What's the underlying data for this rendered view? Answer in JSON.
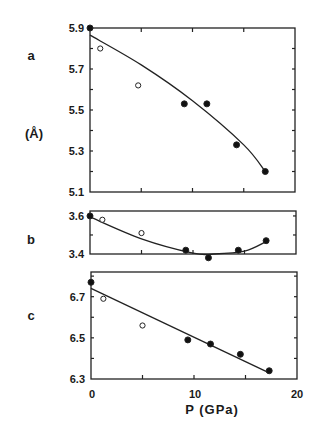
{
  "figure": {
    "ylabel_unit": "(Å)",
    "xlabel": "P (GPa)",
    "x_ticks": [
      "0",
      "10",
      "20"
    ]
  },
  "chart_data": [
    {
      "type": "scatter",
      "panel": "a",
      "title": "a",
      "xlabel": "P (GPa)",
      "ylabel": "(Å)",
      "xlim": [
        0,
        20
      ],
      "ylim": [
        5.1,
        5.9
      ],
      "y_ticks": [
        "5.9",
        "5.7",
        "5.5",
        "5.3",
        "5.1"
      ],
      "series": [
        {
          "name": "open circles",
          "marker": "open",
          "x": [
            1.0,
            4.7
          ],
          "y": [
            5.8,
            5.62
          ]
        },
        {
          "name": "filled circles",
          "marker": "filled",
          "x": [
            0,
            9.2,
            11.4,
            14.3,
            17.1
          ],
          "y": [
            5.9,
            5.53,
            5.53,
            5.33,
            5.2
          ]
        },
        {
          "name": "fit curve",
          "marker": "line",
          "x": [
            0,
            5,
            10,
            15,
            17.1
          ],
          "y": [
            5.865,
            5.72,
            5.545,
            5.33,
            5.2
          ]
        }
      ]
    },
    {
      "type": "scatter",
      "panel": "b",
      "title": "b",
      "xlabel": "P (GPa)",
      "ylabel": "(Å)",
      "xlim": [
        0,
        20
      ],
      "ylim": [
        3.4,
        3.6
      ],
      "y_ticks": [
        "3.6",
        "3.4"
      ],
      "series": [
        {
          "name": "open circles",
          "marker": "open",
          "x": [
            1.2,
            5.0
          ],
          "y": [
            3.58,
            3.51
          ]
        },
        {
          "name": "filled circles",
          "marker": "filled",
          "x": [
            0,
            9.3,
            11.5,
            14.4,
            17.1
          ],
          "y": [
            3.6,
            3.42,
            3.38,
            3.42,
            3.47
          ]
        },
        {
          "name": "fit curve",
          "marker": "line",
          "x": [
            0,
            5,
            10,
            12,
            15,
            17.1
          ],
          "y": [
            3.595,
            3.48,
            3.405,
            3.4,
            3.415,
            3.465
          ]
        }
      ]
    },
    {
      "type": "scatter",
      "panel": "c",
      "title": "c",
      "xlabel": "P (GPa)",
      "ylabel": "(Å)",
      "xlim": [
        0,
        20
      ],
      "ylim": [
        6.3,
        6.8
      ],
      "y_ticks": [
        "6.7",
        "6.5",
        "6.3"
      ],
      "series": [
        {
          "name": "open circles",
          "marker": "open",
          "x": [
            1.2,
            5.0
          ],
          "y": [
            6.69,
            6.56
          ]
        },
        {
          "name": "filled circles",
          "marker": "filled",
          "x": [
            0,
            9.4,
            11.6,
            14.5,
            17.3
          ],
          "y": [
            6.77,
            6.49,
            6.47,
            6.42,
            6.34
          ]
        },
        {
          "name": "fit line",
          "marker": "line",
          "x": [
            0,
            17.3
          ],
          "y": [
            6.74,
            6.33
          ]
        }
      ]
    }
  ]
}
